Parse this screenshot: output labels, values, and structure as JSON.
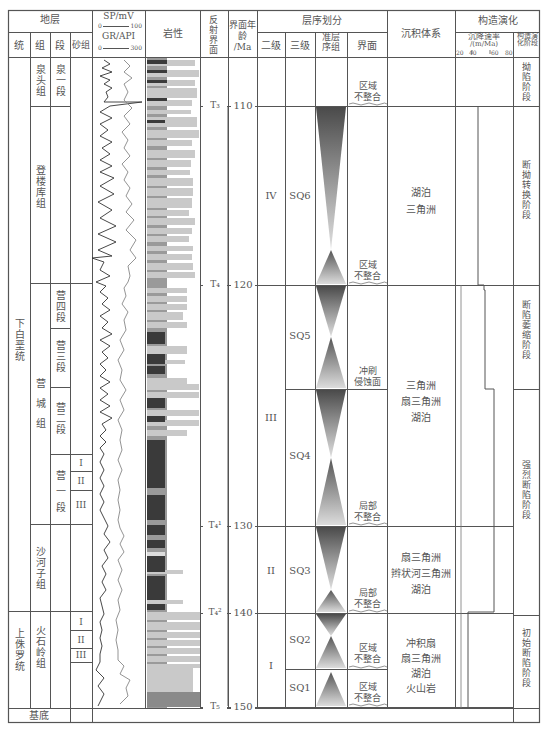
{
  "header": {
    "stratigraphy": "地层",
    "system": "统",
    "formation": "组",
    "member": "段",
    "sand_group": "砂组",
    "sp_label": "SP/mV",
    "sp_range": [
      "0",
      "100"
    ],
    "gr_label": "GR/API",
    "gr_range": [
      "0",
      "300"
    ],
    "lithology": "岩性",
    "reflection": "反射界面",
    "age": "界面年龄",
    "age_unit": "/Ma",
    "sequence": "层序划分",
    "second_order": "二级",
    "third_order": "三级",
    "parasequence_set": "准层序组",
    "boundary": "界面",
    "depositional_system": "沉积体系",
    "tectonic": "构造演化",
    "subsidence_rate": "沉降速率",
    "subsidence_unit": "/(m/Ma)",
    "subsidence_ticks": [
      "20",
      "40",
      "60",
      "80"
    ],
    "tectonic_stage": "构造演化阶段"
  },
  "systems": [
    {
      "label": "下白垩统"
    },
    {
      "label": "上侏罗统"
    }
  ],
  "formations": [
    {
      "label": "泉头组"
    },
    {
      "label": "登楼库组"
    },
    {
      "label": "营城组"
    },
    {
      "label": "沙河子组"
    },
    {
      "label": "火石岭组"
    }
  ],
  "members": [
    {
      "label": "泉一段"
    },
    {
      "label": "营四段"
    },
    {
      "label": "营三段"
    },
    {
      "label": "营二段"
    },
    {
      "label": "营一段"
    }
  ],
  "sand_groups": {
    "ying1": [
      "I",
      "II",
      "III"
    ],
    "huoshiling": [
      "I",
      "II",
      "III"
    ]
  },
  "basement": "基底",
  "reflections": [
    {
      "label": "T₃",
      "age": "110"
    },
    {
      "label": "T₄",
      "age": "120"
    },
    {
      "label": "T₄¹",
      "age": "130"
    },
    {
      "label": "T₄²",
      "age": "140"
    },
    {
      "label": "T₅",
      "age": "150"
    }
  ],
  "second_order": [
    "IV",
    "III",
    "II",
    "I"
  ],
  "third_order": [
    "SQ6",
    "SQ5",
    "SQ4",
    "SQ3",
    "SQ2",
    "SQ1"
  ],
  "boundaries": [
    "区域\n不整合",
    "区域\n不整合",
    "冲刷\n侵蚀面",
    "局部\n不整合",
    "局部\n不整合",
    "区域\n不整合",
    "区域\n不整合"
  ],
  "depositional": [
    "湖泊\n三角洲",
    "三角洲\n扇三角洲\n湖泊",
    "扇三角洲\n辫状河三角洲\n湖泊",
    "冲积扇\n扇三角洲\n湖泊\n火山岩"
  ],
  "tectonic_stages": [
    "拗陷阶段",
    "断拗转换阶段",
    "断陷萎缩阶段",
    "强烈断陷阶段",
    "初始断陷阶段"
  ],
  "colors": {
    "line": "#555555",
    "triangle_dark": "#555555",
    "triangle_light": "#dddddd",
    "mudstone": "#3a3a3a",
    "sandstone": "#c8c8c8"
  }
}
